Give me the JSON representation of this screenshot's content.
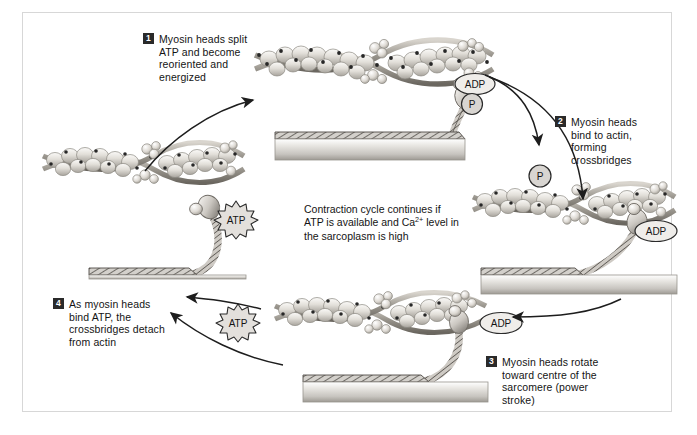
{
  "figure": {
    "border_color": "#d7d7d7",
    "background": "#ffffff"
  },
  "diagram": {
    "type": "cycle",
    "direction": "clockwise",
    "step_count": 4,
    "center_note": {
      "line1": "Contraction cycle continues if",
      "line2_pre": "ATP is available and Ca",
      "line2_sup": "2+",
      "line2_post": " level in",
      "line3": "the sarcoplasm is high"
    },
    "steps": [
      {
        "number": "1",
        "label_lines": [
          "Myosin heads split",
          "ATP and become",
          "reoriented and",
          "energized"
        ],
        "badges": [
          "ADP",
          "P"
        ],
        "head_state": "energized-detached"
      },
      {
        "number": "2",
        "label_lines": [
          "Myosin heads",
          "bind to actin,",
          "forming",
          "crossbridges"
        ],
        "badges": [
          "ADP"
        ],
        "head_state": "bound-crossbridge"
      },
      {
        "number": "3",
        "label_lines": [
          "Myosin heads rotate",
          "toward centre of the",
          "sarcomere (power",
          "stroke)"
        ],
        "badges": [
          "ADP"
        ],
        "head_state": "power-stroke"
      },
      {
        "number": "4",
        "label_lines": [
          "As myosin heads",
          "bind ATP, the",
          "crossbridges detach",
          "from actin"
        ],
        "badges": [
          "ATP"
        ],
        "head_state": "detached"
      }
    ],
    "molecules": [
      {
        "name": "ADP",
        "shape": "ellipse",
        "location": "step1-head"
      },
      {
        "name": "P",
        "shape": "circle",
        "location": "step1-head"
      },
      {
        "name": "P",
        "shape": "circle",
        "location": "released-upper-right"
      },
      {
        "name": "ADP",
        "shape": "ellipse",
        "location": "step2-head"
      },
      {
        "name": "ADP",
        "shape": "ellipse",
        "location": "released-lower-right"
      },
      {
        "name": "ATP",
        "shape": "starburst",
        "location": "step4-head"
      },
      {
        "name": "ATP",
        "shape": "starburst",
        "location": "bottom-centre-left"
      }
    ],
    "structures": {
      "thin_filament": "actin double helix with tropomyosin and troponin",
      "thick_filament": "myosin thick filament cylinder with hatched band",
      "crossbridge": "myosin head and twisted tail"
    },
    "colors": {
      "ink": "#141414",
      "badge_bg": "#2a2a2a",
      "filament_light": "#f2f0ec",
      "filament_mid": "#b9b5ae",
      "filament_dark": "#6e6a63",
      "troponin": "#2c2c2c",
      "thick_top": "#8e8a84",
      "thick_body": "#cfcdc9"
    }
  }
}
